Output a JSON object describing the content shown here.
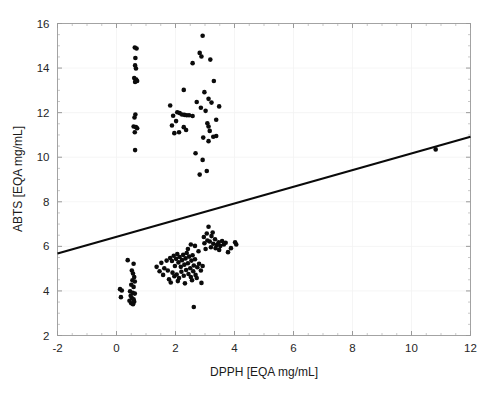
{
  "figure": {
    "background_color": "#ffffff",
    "marker_color": "#0b0b0b",
    "line_color": "#0a0a0a",
    "frame_color": "#9a9a9a"
  },
  "axis": {
    "x_title": "DPPH  [EQA mg/mL]",
    "y_title": "ABTS [EQA mg/mL]",
    "x_ticks": [
      "-2",
      "0",
      "2",
      "4",
      "6",
      "8",
      "10",
      "12"
    ],
    "y_ticks": [
      "2",
      "4",
      "6",
      "8",
      "10",
      "12",
      "14",
      "16"
    ]
  },
  "chart_data": {
    "type": "scatter",
    "title": "",
    "xlabel": "DPPH  [EQA mg/mL]",
    "ylabel": "ABTS [EQA mg/mL]",
    "xlim": [
      -2,
      12
    ],
    "ylim": [
      2,
      16
    ],
    "x_ticks": [
      -2,
      0,
      2,
      4,
      6,
      8,
      10,
      12
    ],
    "y_ticks": [
      2,
      4,
      6,
      8,
      10,
      12,
      14,
      16
    ],
    "x_minor_step": 0.5,
    "y_minor_step": 0.5,
    "grid": "faint-major",
    "legend": "none",
    "series": [
      {
        "name": "Samples",
        "marker": "filled-circle",
        "marker_size_px": 4.6,
        "color": "#0b0b0b",
        "points": [
          [
            0.62,
            14.92
          ],
          [
            0.68,
            14.88
          ],
          [
            0.64,
            14.45
          ],
          [
            0.63,
            14.12
          ],
          [
            0.66,
            13.98
          ],
          [
            0.6,
            13.55
          ],
          [
            0.67,
            13.48
          ],
          [
            0.7,
            13.42
          ],
          [
            0.63,
            13.38
          ],
          [
            0.64,
            11.92
          ],
          [
            0.61,
            11.78
          ],
          [
            0.58,
            11.38
          ],
          [
            0.66,
            11.35
          ],
          [
            0.7,
            11.3
          ],
          [
            0.62,
            11.12
          ],
          [
            0.63,
            10.32
          ],
          [
            2.92,
            15.45
          ],
          [
            2.82,
            14.68
          ],
          [
            2.88,
            14.52
          ],
          [
            3.18,
            14.38
          ],
          [
            2.58,
            14.22
          ],
          [
            3.3,
            13.42
          ],
          [
            2.28,
            13.02
          ],
          [
            2.98,
            12.92
          ],
          [
            3.12,
            12.62
          ],
          [
            2.72,
            12.48
          ],
          [
            3.22,
            12.45
          ],
          [
            1.82,
            12.32
          ],
          [
            3.48,
            12.28
          ],
          [
            2.86,
            12.22
          ],
          [
            3.02,
            12.08
          ],
          [
            2.06,
            12.02
          ],
          [
            2.14,
            11.98
          ],
          [
            2.22,
            11.92
          ],
          [
            2.3,
            11.9
          ],
          [
            2.38,
            11.88
          ],
          [
            2.46,
            11.88
          ],
          [
            1.92,
            11.86
          ],
          [
            2.58,
            11.85
          ],
          [
            3.38,
            11.68
          ],
          [
            2.02,
            11.62
          ],
          [
            3.08,
            11.52
          ],
          [
            1.88,
            11.42
          ],
          [
            3.12,
            11.38
          ],
          [
            2.28,
            11.35
          ],
          [
            2.36,
            11.22
          ],
          [
            3.16,
            11.18
          ],
          [
            2.12,
            11.12
          ],
          [
            1.96,
            11.08
          ],
          [
            3.38,
            10.95
          ],
          [
            3.28,
            10.92
          ],
          [
            2.94,
            10.88
          ],
          [
            3.12,
            10.72
          ],
          [
            2.68,
            10.18
          ],
          [
            2.92,
            9.88
          ],
          [
            3.06,
            9.38
          ],
          [
            2.82,
            9.22
          ],
          [
            10.82,
            10.35
          ],
          [
            0.38,
            5.38
          ],
          [
            0.58,
            5.22
          ],
          [
            0.52,
            4.92
          ],
          [
            0.56,
            4.78
          ],
          [
            0.6,
            4.62
          ],
          [
            0.54,
            4.48
          ],
          [
            0.62,
            4.42
          ],
          [
            0.5,
            4.28
          ],
          [
            0.58,
            4.18
          ],
          [
            0.12,
            4.08
          ],
          [
            0.18,
            4.02
          ],
          [
            0.46,
            3.98
          ],
          [
            0.55,
            3.92
          ],
          [
            0.62,
            3.88
          ],
          [
            0.48,
            3.78
          ],
          [
            0.15,
            3.72
          ],
          [
            0.52,
            3.68
          ],
          [
            0.58,
            3.62
          ],
          [
            0.44,
            3.56
          ],
          [
            0.6,
            3.52
          ],
          [
            0.5,
            3.45
          ],
          [
            0.56,
            3.4
          ],
          [
            1.36,
            5.08
          ],
          [
            1.52,
            5.26
          ],
          [
            1.46,
            4.88
          ],
          [
            1.62,
            5.02
          ],
          [
            1.7,
            5.36
          ],
          [
            1.58,
            4.72
          ],
          [
            1.74,
            4.92
          ],
          [
            1.82,
            5.48
          ],
          [
            1.88,
            5.34
          ],
          [
            1.94,
            5.58
          ],
          [
            1.98,
            5.12
          ],
          [
            2.02,
            5.44
          ],
          [
            2.06,
            5.66
          ],
          [
            2.1,
            5.28
          ],
          [
            2.14,
            5.52
          ],
          [
            2.18,
            5.08
          ],
          [
            2.22,
            5.38
          ],
          [
            2.26,
            5.62
          ],
          [
            2.3,
            5.18
          ],
          [
            2.34,
            5.46
          ],
          [
            2.38,
            5.7
          ],
          [
            2.42,
            5.24
          ],
          [
            2.46,
            5.54
          ],
          [
            2.5,
            5.02
          ],
          [
            2.54,
            5.36
          ],
          [
            2.58,
            5.6
          ],
          [
            2.62,
            5.14
          ],
          [
            2.66,
            5.42
          ],
          [
            1.9,
            4.82
          ],
          [
            1.96,
            4.66
          ],
          [
            2.04,
            4.74
          ],
          [
            2.12,
            4.58
          ],
          [
            2.2,
            4.86
          ],
          [
            2.28,
            4.68
          ],
          [
            2.36,
            4.94
          ],
          [
            2.44,
            4.76
          ],
          [
            2.52,
            4.62
          ],
          [
            2.6,
            4.88
          ],
          [
            2.68,
            4.72
          ],
          [
            2.74,
            5.06
          ],
          [
            1.78,
            4.52
          ],
          [
            1.84,
            4.38
          ],
          [
            2.08,
            4.44
          ],
          [
            2.32,
            4.34
          ],
          [
            2.56,
            4.48
          ],
          [
            2.72,
            4.58
          ],
          [
            2.8,
            5.22
          ],
          [
            2.86,
            4.92
          ],
          [
            2.92,
            5.12
          ],
          [
            2.42,
            5.88
          ],
          [
            2.52,
            6.08
          ],
          [
            2.66,
            6.02
          ],
          [
            2.78,
            5.78
          ],
          [
            2.88,
            4.36
          ],
          [
            2.62,
            3.28
          ],
          [
            2.96,
            6.42
          ],
          [
            3.06,
            6.58
          ],
          [
            3.16,
            6.22
          ],
          [
            3.22,
            6.46
          ],
          [
            3.28,
            6.12
          ],
          [
            3.34,
            6.32
          ],
          [
            3.4,
            6.06
          ],
          [
            3.12,
            6.88
          ],
          [
            3.46,
            6.18
          ],
          [
            3.52,
            6.02
          ],
          [
            3.58,
            6.24
          ],
          [
            3.64,
            6.08
          ],
          [
            3.7,
            6.16
          ],
          [
            3.2,
            5.96
          ],
          [
            3.36,
            5.92
          ],
          [
            3.48,
            5.84
          ],
          [
            3.02,
            5.88
          ],
          [
            2.98,
            6.14
          ],
          [
            3.26,
            6.62
          ],
          [
            3.08,
            6.26
          ],
          [
            4.02,
            6.18
          ],
          [
            4.06,
            6.08
          ],
          [
            3.78,
            5.74
          ],
          [
            3.88,
            5.92
          ]
        ]
      }
    ],
    "fit_line": {
      "name": "Linear fit",
      "x": [
        -2,
        12
      ],
      "y": [
        5.68,
        10.92
      ],
      "slope": 0.374,
      "intercept": 6.43
    }
  }
}
